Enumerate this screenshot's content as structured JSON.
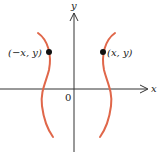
{
  "diagram": {
    "axes": {
      "x_label": "x",
      "y_label": "y",
      "origin_label": "0",
      "color": "#333333"
    },
    "curve": {
      "color": "#e0674a",
      "description": "Graph symmetric with respect to the y-axis"
    },
    "points": [
      {
        "label": "(−x, y)",
        "side": "left"
      },
      {
        "label": "(x, y)",
        "side": "right"
      }
    ]
  }
}
